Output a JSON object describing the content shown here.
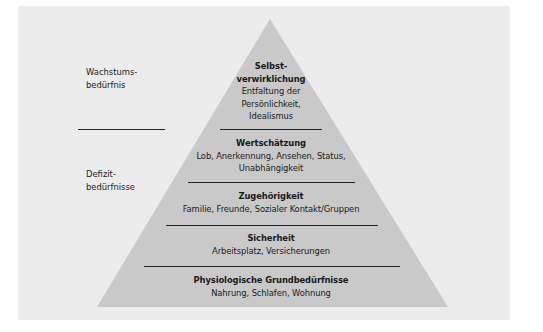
{
  "diagram": {
    "type": "pyramid",
    "side_labels": {
      "growth": [
        "Wachstums-",
        "bedürfnis"
      ],
      "deficit": [
        "Defizit-",
        "bedürfnisse"
      ]
    },
    "levels": [
      {
        "title_lines": [
          "Selbst-",
          "verwirklichung"
        ],
        "desc_lines": [
          "Entfaltung der",
          "Persönlichkeit,",
          "Idealismus"
        ]
      },
      {
        "title_lines": [
          "Wertschätzung"
        ],
        "desc_lines": [
          "Lob, Anerkennung, Ansehen, Status,",
          "Unabhängigkeit"
        ]
      },
      {
        "title_lines": [
          "Zugehörigkeit"
        ],
        "desc_lines": [
          "Familie, Freunde, Sozialer Kontakt/Gruppen"
        ]
      },
      {
        "title_lines": [
          "Sicherheit"
        ],
        "desc_lines": [
          "Arbeitsplatz, Versicherungen"
        ]
      },
      {
        "title_lines": [
          "Physiologische Grundbedürfnisse"
        ],
        "desc_lines": [
          "Nahrung, Schlafen, Wohnung"
        ]
      }
    ],
    "colors": {
      "background": "#ececec",
      "pyramid": "#c9c9c9",
      "lines": "#222222"
    }
  }
}
